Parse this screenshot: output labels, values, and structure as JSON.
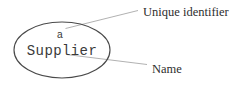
{
  "diagram": {
    "type": "uml-object-instance",
    "background_color": "#ffffff",
    "node": {
      "shape": "ellipse",
      "stroke_color": "#4a4a4a",
      "text_color": "#3a3a3a",
      "unique_identifier": "a",
      "name": "Supplier",
      "full_label": "a Supplier"
    },
    "annotations": [
      {
        "label": "Unique identifier",
        "target": "unique-identifier-text",
        "leader_color": "#a8a8a8",
        "position": "top-right"
      },
      {
        "label": "Name",
        "target": "name-text",
        "leader_color": "#a8a8a8",
        "position": "bottom-right"
      }
    ]
  }
}
